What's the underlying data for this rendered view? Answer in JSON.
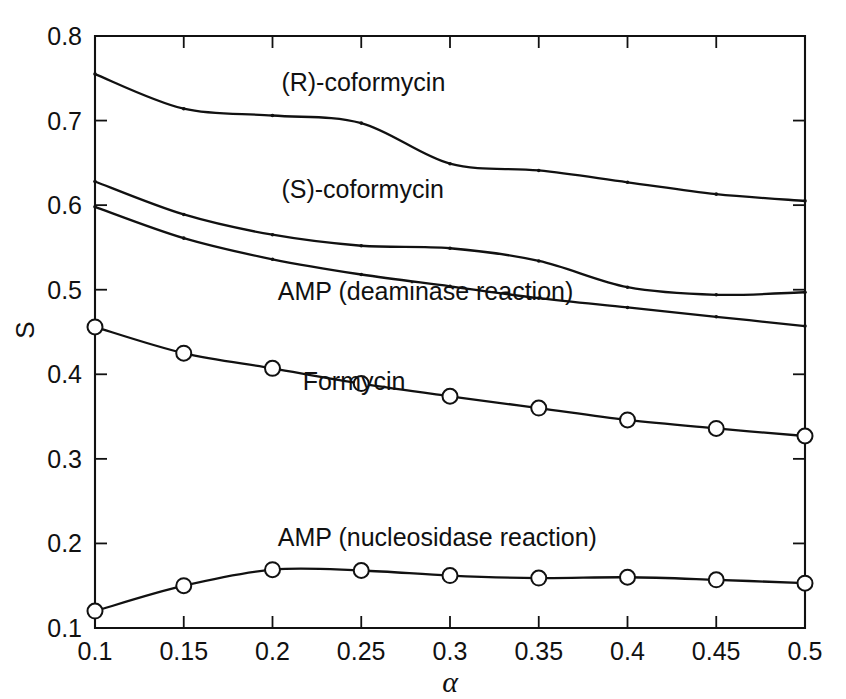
{
  "figure": {
    "top_cut_text": "",
    "background": "#ffffff",
    "ink_color": "#111111"
  },
  "chart_data": {
    "type": "line",
    "title": "",
    "xlabel": "α",
    "ylabel": "S",
    "xlim": [
      0.1,
      0.5
    ],
    "ylim": [
      0.1,
      0.8
    ],
    "grid": false,
    "legend_position": "inline-annotations",
    "xticks": [
      0.1,
      0.15,
      0.2,
      0.25,
      0.3,
      0.35,
      0.4,
      0.45,
      0.5
    ],
    "xticklabels": [
      "0.1",
      "0.15",
      "0.2",
      "0.25",
      "0.3",
      "0.35",
      "0.4",
      "0.45",
      "0.5"
    ],
    "yticks": [
      0.1,
      0.2,
      0.3,
      0.4,
      0.5,
      0.6,
      0.7,
      0.8
    ],
    "yticklabels": [
      "0.1",
      "0.2",
      "0.3",
      "0.4",
      "0.5",
      "0.6",
      "0.7",
      "0.8"
    ],
    "x": [
      0.1,
      0.15,
      0.2,
      0.25,
      0.3,
      0.35,
      0.4,
      0.45,
      0.5
    ],
    "series": [
      {
        "name": "(R)-coformycin",
        "marker": "dot",
        "label_x": 0.205,
        "label_y": 0.735,
        "values": [
          0.755,
          0.714,
          0.706,
          0.697,
          0.649,
          0.641,
          0.627,
          0.613,
          0.605
        ]
      },
      {
        "name": "(S)-coformycin",
        "marker": "dot",
        "label_x": 0.205,
        "label_y": 0.609,
        "values": [
          0.628,
          0.589,
          0.565,
          0.552,
          0.549,
          0.534,
          0.503,
          0.494,
          0.497
        ]
      },
      {
        "name": "AMP (deaminase reaction)",
        "marker": "dot",
        "label_x": 0.203,
        "label_y": 0.488,
        "values": [
          0.598,
          0.561,
          0.536,
          0.518,
          0.504,
          0.49,
          0.479,
          0.468,
          0.457
        ]
      },
      {
        "name": "Formycin",
        "marker": "circle",
        "label_x": 0.217,
        "label_y": 0.381,
        "values": [
          0.456,
          0.425,
          0.407,
          0.389,
          0.374,
          0.36,
          0.346,
          0.336,
          0.327
        ]
      },
      {
        "name": "AMP (nucleosidase reaction)",
        "marker": "circle",
        "label_x": 0.203,
        "label_y": 0.197,
        "values": [
          0.12,
          0.15,
          0.169,
          0.168,
          0.162,
          0.159,
          0.16,
          0.157,
          0.153
        ]
      }
    ]
  },
  "axes_geometry": {
    "left_px": 95,
    "right_px": 805,
    "top_px": 36,
    "bottom_px": 628
  }
}
